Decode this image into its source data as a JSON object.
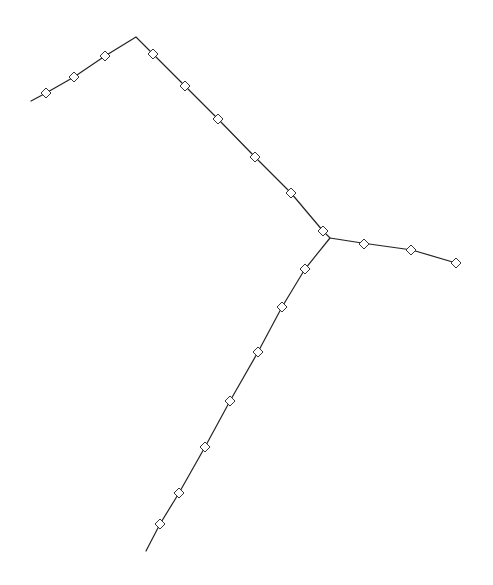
{
  "diagram": {
    "type": "branched-path",
    "colors": {
      "line": "#222222",
      "node_stroke": "#333333",
      "background": "#ffffff"
    },
    "branches": [
      {
        "name": "upper-left-arm",
        "points": [
          [
            31,
            101
          ],
          [
            46,
            93
          ],
          [
            74,
            77
          ],
          [
            105,
            56
          ],
          [
            136,
            37
          ],
          [
            153,
            54
          ],
          [
            185,
            86
          ],
          [
            218,
            119
          ],
          [
            255,
            157
          ],
          [
            291,
            193
          ],
          [
            323,
            231
          ]
        ],
        "nodes": [
          [
            46,
            93
          ],
          [
            74,
            77
          ],
          [
            105,
            56
          ],
          [
            153,
            54
          ],
          [
            185,
            86
          ],
          [
            218,
            119
          ],
          [
            255,
            157
          ],
          [
            291,
            193
          ],
          [
            323,
            231
          ]
        ]
      },
      {
        "name": "right-arm",
        "points": [
          [
            323,
            231
          ],
          [
            330,
            238
          ],
          [
            362,
            243
          ],
          [
            412,
            250
          ],
          [
            456,
            263
          ]
        ],
        "nodes": [
          [
            364,
            244
          ],
          [
            411,
            250
          ],
          [
            456,
            263
          ]
        ]
      },
      {
        "name": "lower-arm",
        "points": [
          [
            330,
            238
          ],
          [
            305,
            269
          ],
          [
            282,
            307
          ],
          [
            258,
            352
          ],
          [
            230,
            401
          ],
          [
            205,
            447
          ],
          [
            179,
            493
          ],
          [
            160,
            524
          ],
          [
            146,
            551
          ]
        ],
        "nodes": [
          [
            305,
            269
          ],
          [
            282,
            307
          ],
          [
            258,
            352
          ],
          [
            230,
            401
          ],
          [
            205,
            447
          ],
          [
            179,
            493
          ],
          [
            160,
            524
          ]
        ]
      }
    ]
  }
}
